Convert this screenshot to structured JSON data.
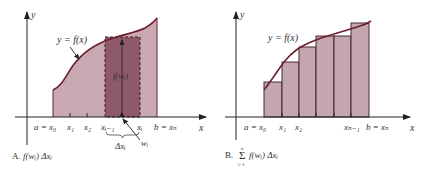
{
  "panels": [
    {
      "id": "A",
      "caption_letter": "A.",
      "caption_expr": "f(wᵢ) Δxᵢ",
      "axis_y_label": "y",
      "axis_x_label": "x",
      "curve_label": "y = f(x)",
      "height_label": "f(wᵢ)",
      "ticks": [
        "a = x₀",
        "x₁",
        "x₂",
        "xᵢ₋₁",
        "xᵢ",
        "b = xₙ"
      ],
      "width_label": "Δxᵢ",
      "point_label": "wᵢ"
    },
    {
      "id": "B",
      "caption_letter": "B.",
      "caption_sum": "Σ",
      "caption_sum_top": "n",
      "caption_sum_bottom": "i=1",
      "caption_expr": "f(wᵢ) Δxᵢ",
      "axis_y_label": "y",
      "axis_x_label": "x",
      "curve_label": "y = f(x)",
      "ticks": [
        "a = x₀",
        "x₁",
        "x₂",
        "xₙ₋₁",
        "b = xₙ"
      ]
    }
  ],
  "colors": {
    "region_fill": "#c9a9b1",
    "rect_dark": "#8e5a69",
    "curve": "#6b1f2e",
    "axis": "#222222",
    "rect_fill_b": "#c4a6ae"
  }
}
